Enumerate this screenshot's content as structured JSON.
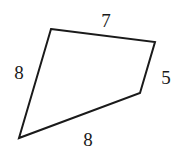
{
  "figure": {
    "shape_type": "quadrilateral",
    "stroke_color": "#1a1a1a",
    "fill_color": "#ffffff",
    "background_color": "#ffffff",
    "stroke_width": 2,
    "vertices": [
      {
        "name": "top-left",
        "x": 51,
        "y": 29
      },
      {
        "name": "top-right",
        "x": 155,
        "y": 42
      },
      {
        "name": "right-lower",
        "x": 140,
        "y": 93
      },
      {
        "name": "bottom-left",
        "x": 19,
        "y": 138
      }
    ],
    "points_attr": "51,29 155,42 140,93 19,138",
    "labels": {
      "top": "7",
      "left": "8",
      "right": "5",
      "bottom": "8"
    },
    "sides": [
      {
        "id": "top",
        "from": "top-left",
        "to": "top-right",
        "length": "7"
      },
      {
        "id": "right",
        "from": "top-right",
        "to": "right-lower",
        "length": "5"
      },
      {
        "id": "bottom",
        "from": "right-lower",
        "to": "bottom-left",
        "length": "8"
      },
      {
        "id": "left",
        "from": "bottom-left",
        "to": "top-left",
        "length": "8"
      }
    ]
  }
}
